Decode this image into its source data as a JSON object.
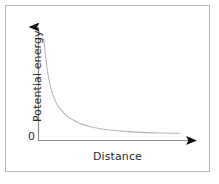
{
  "figure": {
    "background_color": "#ffffff",
    "frame_color": "#b9b9b9",
    "axis_color": "#8c8c8c",
    "curve_color": "#b5b5b5",
    "arrow_color": "#111111",
    "text_color": "#2b2b2b",
    "origin_label": "0"
  },
  "chart_data": {
    "type": "line",
    "title": "",
    "subtitle": "",
    "xlabel": "Distance",
    "ylabel": "Potential energy",
    "x_tick_labels": [],
    "y_tick_labels": [
      "0"
    ],
    "grid": false,
    "legend": null,
    "legend_position": "none",
    "axis_arrows": {
      "x": "arrow-right",
      "y": "arrow-up"
    },
    "xlim": [
      0,
      10
    ],
    "ylim": [
      0,
      10
    ],
    "annotations": [],
    "series": [
      {
        "name": "Potential energy",
        "description": "Monotonically decreasing inverse-type decay curve approaching zero asymptotically",
        "x": [
          0.35,
          0.5,
          0.7,
          0.9,
          1.2,
          1.5,
          2.0,
          2.5,
          3.0,
          3.6,
          4.2,
          5.0,
          5.8,
          6.6,
          7.4,
          8.2,
          9.0,
          9.6
        ],
        "y": [
          9.5,
          7.6,
          5.7,
          4.6,
          3.5,
          2.9,
          2.2,
          1.8,
          1.5,
          1.25,
          1.1,
          0.95,
          0.85,
          0.78,
          0.73,
          0.7,
          0.68,
          0.67
        ]
      }
    ]
  }
}
